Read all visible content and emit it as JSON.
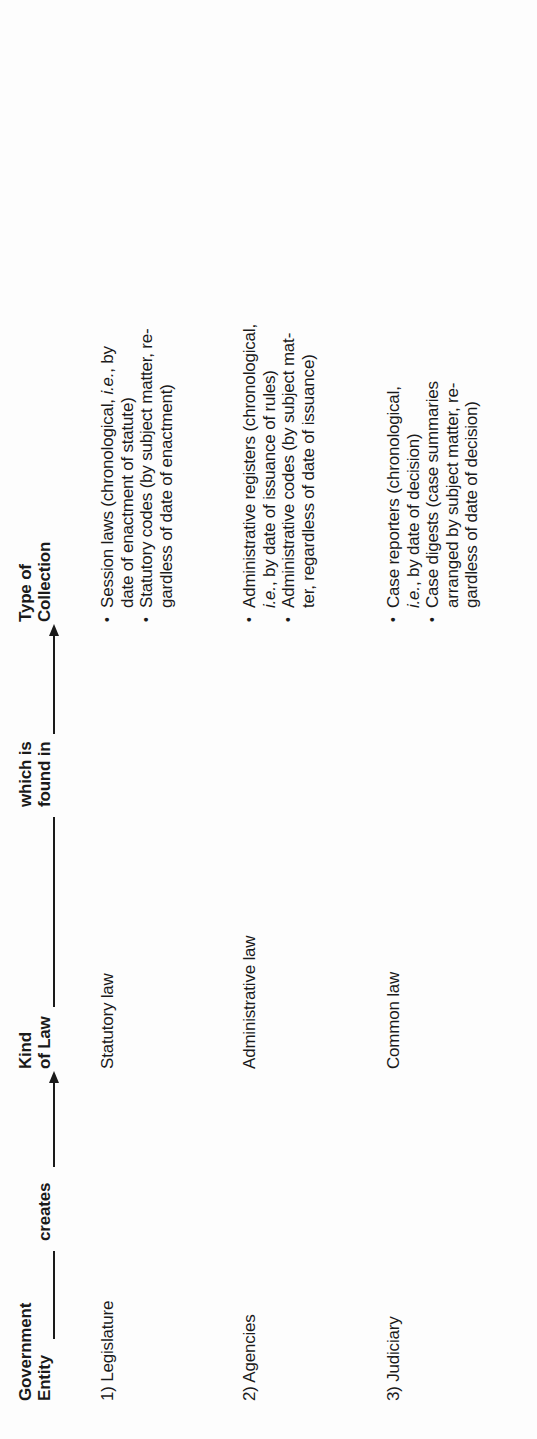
{
  "header": {
    "col_entity_line1": "Government",
    "col_entity_line2": "Entity",
    "connector_creates": "creates",
    "col_kind_line1": "Kind",
    "col_kind_line2": "of Law",
    "connector_found_line1": "which is",
    "connector_found_line2": "found in",
    "col_collection_line1": "Type of",
    "col_collection_line2": "Collection"
  },
  "rows": [
    {
      "entity": "1) Legislature",
      "kind": "Statutory law",
      "collections": [
        {
          "lines": [
            "Session laws (chronological, i.e., by",
            "date of enactment of statute)"
          ]
        },
        {
          "lines": [
            "Statutory codes (by subject matter, re-",
            "gardless of date of enactment)"
          ]
        }
      ]
    },
    {
      "entity": "2) Agencies",
      "kind": "Administrative law",
      "collections": [
        {
          "lines": [
            "Administrative registers (chronological,",
            "i.e., by date of issuance of rules)"
          ]
        },
        {
          "lines": [
            "Administrative codes (by subject mat-",
            "ter, regardless of date of issuance)"
          ]
        }
      ]
    },
    {
      "entity": "3) Judiciary",
      "kind": "Common law",
      "collections": [
        {
          "lines": [
            "Case reporters (chronological,",
            "i.e., by date of decision)"
          ]
        },
        {
          "lines": [
            "Case digests (case summaries",
            "arranged by subject matter, re-",
            "gardless of date of decision)"
          ]
        }
      ]
    }
  ],
  "colors": {
    "text": "#1a1a1a",
    "background": "#fdfdfd"
  }
}
